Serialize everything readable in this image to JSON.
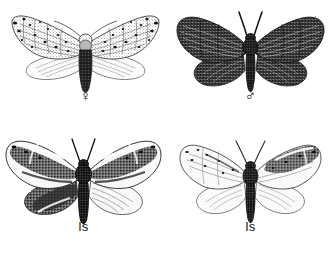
{
  "plate": {
    "type": "scientific-illustration-plate",
    "subject": "moths",
    "style": "black-and-white stipple engraving",
    "background_color": "#ffffff",
    "ink_color": "#1a1a1a",
    "rows": 2,
    "columns": 2
  },
  "figures": [
    {
      "id": "female",
      "position": "top-left",
      "label": "♀",
      "label_meaning": "female",
      "description": "Pale moth with broad outspread wings, fine dark vein network and scattered dark spots on forewings, very pale translucent hindwings, stout dark banded abdomen",
      "forewing_tone": "pale",
      "hindwing_tone": "very-pale",
      "abdomen_tone": "dark"
    },
    {
      "id": "male",
      "position": "top-right",
      "label": "♂",
      "label_meaning": "male",
      "description": "Dark heavily stippled moth, uniformly sooty wings with lighter vein streaks, prominent forward antennae, stout dark thorax and tapering abdomen",
      "forewing_tone": "dark",
      "hindwing_tone": "dark",
      "abdomen_tone": "dark"
    },
    {
      "id": "ls-left",
      "position": "bottom-left",
      "label": "ls",
      "label_meaning": "ls",
      "description": "Strongly banded moth with bold dark and white contrasting bands across forewings, dark shaded inner hindwing, very dark hairy thorax and long dark abdomen",
      "forewing_tone": "banded-dark-and-white",
      "hindwing_tone": "mixed",
      "abdomen_tone": "very-dark"
    },
    {
      "id": "ls-right",
      "position": "bottom-right",
      "label": "ls",
      "label_meaning": "ls",
      "description": "Pale moth with mostly whitish wings, dark markings concentrated along the leading edge and wing tips, plain pale hindwings, dark slender abdomen",
      "forewing_tone": "pale-with-dark-costal-markings",
      "hindwing_tone": "pale",
      "abdomen_tone": "dark"
    }
  ]
}
